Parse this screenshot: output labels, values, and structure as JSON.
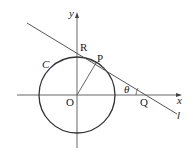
{
  "diagram": {
    "labels": {
      "y_axis": "y",
      "x_axis": "x",
      "origin": "O",
      "circle": "C",
      "point_p": "P",
      "point_r": "R",
      "point_q": "Q",
      "angle": "θ",
      "line": "l"
    },
    "colors": {
      "stroke": "#333333",
      "background": "#ffffff"
    }
  }
}
